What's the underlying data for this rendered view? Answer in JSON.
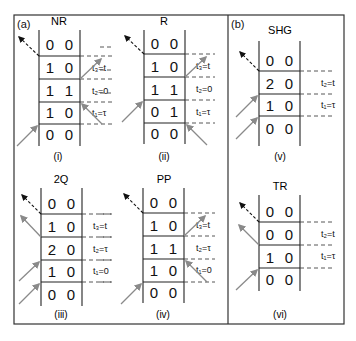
{
  "figure": {
    "panel_a_label": "(a)",
    "panel_b_label": "(b)",
    "colors": {
      "frame": "#333333",
      "grid": "#222222",
      "arrow_gray": "#8a8a8a",
      "arrow_black": "#111111",
      "dashed": "#444444"
    },
    "diagrams": [
      {
        "id": "NR",
        "title": "NR",
        "sublabel": "(i)",
        "rows": [
          [
            "0",
            "0"
          ],
          [
            "1",
            "0"
          ],
          [
            "1",
            "1"
          ],
          [
            "1",
            "0"
          ],
          [
            "0",
            "0"
          ]
        ],
        "time_labels": [
          "t₃=t",
          "t₂=0",
          "t₁=τ"
        ]
      },
      {
        "id": "R",
        "title": "R",
        "sublabel": "(ii)",
        "rows": [
          [
            "0",
            "0"
          ],
          [
            "1",
            "0"
          ],
          [
            "1",
            "1"
          ],
          [
            "0",
            "1"
          ],
          [
            "0",
            "0"
          ]
        ],
        "time_labels": [
          "t₃=t",
          "t₂=0",
          "t₁=τ"
        ]
      },
      {
        "id": "2Q",
        "title": "2Q",
        "sublabel": "(iii)",
        "rows": [
          [
            "0",
            "0"
          ],
          [
            "1",
            "0"
          ],
          [
            "2",
            "0"
          ],
          [
            "1",
            "0"
          ],
          [
            "0",
            "0"
          ]
        ],
        "time_labels": [
          "t₃=t",
          "t₂=τ",
          "t₁=0"
        ]
      },
      {
        "id": "PP",
        "title": "PP",
        "sublabel": "(iv)",
        "rows": [
          [
            "0",
            "0"
          ],
          [
            "1",
            "0"
          ],
          [
            "1",
            "1"
          ],
          [
            "1",
            "0"
          ],
          [
            "0",
            "0"
          ]
        ],
        "time_labels": [
          "t₃=t",
          "t₂=τ",
          "t₁=0"
        ]
      },
      {
        "id": "SHG",
        "title": "SHG",
        "sublabel": "(v)",
        "rows": [
          [
            "0",
            "0"
          ],
          [
            "2",
            "0"
          ],
          [
            "1",
            "0"
          ],
          [
            "0",
            "0"
          ]
        ],
        "time_labels": [
          "t₂=t",
          "t₁=τ"
        ]
      },
      {
        "id": "TR",
        "title": "TR",
        "sublabel": "(vi)",
        "rows": [
          [
            "0",
            "0"
          ],
          [
            "0",
            "0"
          ],
          [
            "1",
            "0"
          ],
          [
            "0",
            "0"
          ]
        ],
        "time_labels": [
          "t₂=t",
          "t₁=τ"
        ]
      }
    ]
  }
}
